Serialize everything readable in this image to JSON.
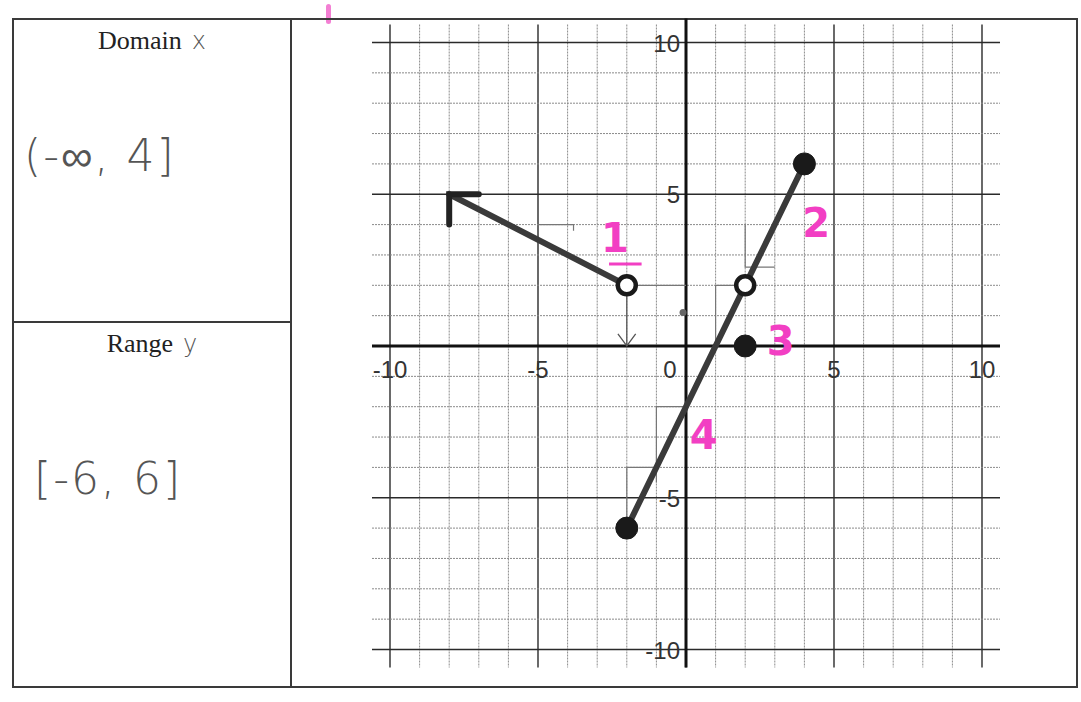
{
  "worksheet": {
    "domain_cell": {
      "label": "Domain",
      "variable": "x",
      "answer": "(-∞, 4]"
    },
    "range_cell": {
      "label": "Range",
      "variable": "y",
      "answer": "[-6, 6]"
    }
  },
  "colors": {
    "ink": "#3a3a3a",
    "pencil": "#555555",
    "highlight_pink": "#f23fc3",
    "grid_major": "#2a2a2a",
    "grid_minor": "#8a8a8a"
  },
  "chart_data": {
    "type": "line",
    "title": "",
    "xlabel": "",
    "ylabel": "",
    "xlim": [
      -10,
      10
    ],
    "ylim": [
      -10,
      10
    ],
    "grid": true,
    "grid_step": 1,
    "x_tick_labels": [
      "-10",
      "-5",
      "0",
      "5",
      "10"
    ],
    "y_tick_labels": [
      "10",
      "5",
      "-5",
      "-10"
    ],
    "series": [
      {
        "name": "ray",
        "type": "ray",
        "points": [
          [
            -2,
            2
          ],
          [
            -8,
            5
          ]
        ],
        "start_marker": "open",
        "end": "arrow"
      },
      {
        "name": "segment",
        "type": "segment",
        "points": [
          [
            -2,
            -6
          ],
          [
            4,
            6
          ]
        ],
        "start_marker": "closed",
        "end_marker": "closed"
      }
    ],
    "markers": [
      {
        "x": -2,
        "y": 2,
        "style": "open"
      },
      {
        "x": 2,
        "y": 2,
        "style": "open"
      },
      {
        "x": 2,
        "y": 0,
        "style": "closed"
      },
      {
        "x": 4,
        "y": 6,
        "style": "closed"
      },
      {
        "x": -2,
        "y": -6,
        "style": "closed"
      }
    ],
    "annotations": [
      {
        "text": "1",
        "x": -2.4,
        "y": 3.1,
        "color": "#f23fc3"
      },
      {
        "text": "2",
        "x": 4.4,
        "y": 3.6,
        "color": "#f23fc3"
      },
      {
        "text": "3",
        "x": 3.2,
        "y": -0.3,
        "color": "#f23fc3"
      },
      {
        "text": "4",
        "x": 0.6,
        "y": -3.4,
        "color": "#f23fc3"
      }
    ]
  }
}
